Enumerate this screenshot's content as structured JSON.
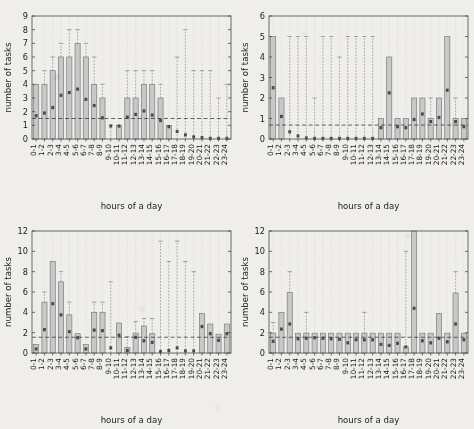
{
  "figure": {
    "background_color": "#efeeea",
    "panel_count": 4,
    "shared_xlabel": "hours of a day",
    "shared_ylabel": "number of tasks",
    "hour_categories": [
      "0-1",
      "1-2",
      "2-3",
      "3-4",
      "4-5",
      "5-6",
      "6-7",
      "7-8",
      "8-9",
      "9-10",
      "10-11",
      "11-12",
      "12-13",
      "13-14",
      "14-15",
      "15-16",
      "16-17",
      "17-18",
      "18-19",
      "19-20",
      "20-21",
      "21-22",
      "22-23",
      "23-24"
    ],
    "bar_fill_color": "#c8c8c8",
    "bar_edge_color": "#7d7d7d",
    "median_marker_color": "#4a4a4a",
    "whisker_color": "#8e8e8e",
    "mean_line_color": "#333333"
  },
  "chart_data": [
    {
      "id": "panel-top-left",
      "type": "bar",
      "title": "",
      "xlabel": "hours of a day",
      "ylabel": "number of tasks",
      "xlim": [
        0,
        24
      ],
      "ylim": [
        0,
        9
      ],
      "yticks": [
        0,
        1,
        2,
        3,
        4,
        5,
        6,
        7,
        8,
        9
      ],
      "ytick_labels": [
        "0",
        "1",
        "2",
        "3",
        "4",
        "5",
        "6",
        "7",
        "8",
        "9"
      ],
      "grid": "vertical-dashed",
      "mean_reference_line": 1.5,
      "categories": [
        "0-1",
        "1-2",
        "2-3",
        "3-4",
        "4-5",
        "5-6",
        "6-7",
        "7-8",
        "8-9",
        "9-10",
        "10-11",
        "11-12",
        "12-13",
        "13-14",
        "14-15",
        "15-16",
        "16-17",
        "17-18",
        "18-19",
        "19-20",
        "20-21",
        "21-22",
        "22-23",
        "23-24"
      ],
      "values": [
        4,
        4,
        5,
        6,
        6,
        7,
        6,
        4,
        3,
        0,
        1,
        3,
        3,
        4,
        4,
        3,
        1,
        0,
        0,
        0,
        0,
        0,
        0,
        0
      ],
      "medians": [
        1.7,
        1.9,
        2.3,
        3.2,
        3.4,
        3.65,
        2.9,
        2.45,
        1.55,
        0.95,
        0.95,
        1.6,
        1.8,
        2.05,
        1.75,
        1.35,
        0.9,
        0.55,
        0.3,
        0.15,
        0.1,
        0.05,
        0.05,
        0.05
      ],
      "whisker_tops": [
        4,
        5,
        6,
        7,
        8,
        8,
        7,
        6,
        4,
        1,
        1,
        5,
        5,
        5,
        5,
        4,
        1,
        6,
        8,
        5,
        5,
        5,
        3,
        4
      ]
    },
    {
      "id": "panel-top-right",
      "type": "bar",
      "title": "",
      "xlabel": "hours of a day",
      "ylabel": "number of tasks",
      "xlim": [
        0,
        24
      ],
      "ylim": [
        0,
        6
      ],
      "yticks": [
        0,
        1,
        2,
        3,
        4,
        5,
        6
      ],
      "ytick_labels": [
        "0",
        "1",
        "2",
        "3",
        "4",
        "5",
        "6"
      ],
      "grid": "vertical-dashed",
      "mean_reference_line": 0.68,
      "categories": [
        "0-1",
        "1-2",
        "2-3",
        "3-4",
        "4-5",
        "5-6",
        "6-7",
        "7-8",
        "8-9",
        "9-10",
        "10-11",
        "11-12",
        "12-13",
        "13-14",
        "14-15",
        "15-16",
        "16-17",
        "17-18",
        "18-19",
        "19-20",
        "20-21",
        "21-22",
        "22-23",
        "23-24"
      ],
      "values": [
        5,
        2,
        0,
        0,
        0,
        0,
        0,
        0,
        0,
        0,
        0,
        0,
        0,
        1,
        4,
        1,
        1,
        2,
        2,
        1,
        2,
        5,
        1,
        1
      ],
      "medians": [
        2.5,
        1.1,
        0.35,
        0.15,
        0.05,
        0.03,
        0.03,
        0.03,
        0.03,
        0.03,
        0.03,
        0.03,
        0.03,
        0.55,
        2.25,
        0.6,
        0.55,
        0.95,
        1.22,
        0.85,
        1.05,
        2.38,
        0.85,
        0.6
      ],
      "whisker_tops": [
        5,
        2,
        5,
        5,
        5,
        2,
        5,
        5,
        4,
        5,
        5,
        5,
        5,
        1,
        4,
        1,
        1,
        2,
        2,
        2,
        2,
        5,
        2,
        1
      ]
    },
    {
      "id": "panel-bottom-left",
      "type": "bar",
      "title": "",
      "xlabel": "hours of a day",
      "ylabel": "number of tasks",
      "xlim": [
        0,
        24
      ],
      "ylim": [
        0,
        12
      ],
      "yticks": [
        0,
        2,
        4,
        6,
        8,
        10,
        12
      ],
      "ytick_labels": [
        "0",
        "2",
        "4",
        "6",
        "8",
        "10",
        "12"
      ],
      "grid": "vertical-dashed",
      "mean_reference_line": 1.55,
      "categories": [
        "0-1",
        "1-2",
        "2-3",
        "3-4",
        "4-5",
        "5-6",
        "6-7",
        "7-8",
        "8-9",
        "9-10",
        "10-11",
        "11-12",
        "12-13",
        "13-14",
        "14-15",
        "15-16",
        "16-17",
        "17-18",
        "18-19",
        "19-20",
        "20-21",
        "21-22",
        "22-23",
        "23-24"
      ],
      "values": [
        0.85,
        5,
        9,
        7,
        3.75,
        1.9,
        0.85,
        4,
        4,
        0,
        2.95,
        0.55,
        1.95,
        2.65,
        1.9,
        0,
        0,
        0,
        0,
        0,
        3.9,
        2.85,
        1.85,
        2.85
      ],
      "medians": [
        0.4,
        2.3,
        4.85,
        3.75,
        2.1,
        1.5,
        0.4,
        2.25,
        2.2,
        0.5,
        1.75,
        0.25,
        1.55,
        1.2,
        1.05,
        0.15,
        0.25,
        0.5,
        0.2,
        0.2,
        2.6,
        1.9,
        1.25,
        1.9
      ],
      "whisker_tops": [
        0.85,
        6,
        9,
        8,
        5,
        1.9,
        0.85,
        5,
        5,
        7,
        2.95,
        1.6,
        3.1,
        3.4,
        3.4,
        11,
        9,
        11,
        9,
        8,
        3.9,
        2.85,
        1.85,
        2.85
      ]
    },
    {
      "id": "panel-bottom-right",
      "type": "bar",
      "title": "",
      "xlabel": "hours of a day",
      "ylabel": "number of tasks",
      "xlim": [
        0,
        24
      ],
      "ylim": [
        0,
        12
      ],
      "yticks": [
        0,
        2,
        4,
        6,
        8,
        10,
        12
      ],
      "ytick_labels": [
        "0",
        "2",
        "4",
        "6",
        "8",
        "10",
        "12"
      ],
      "grid": "vertical-dashed",
      "mean_reference_line": 1.55,
      "categories": [
        "0-1",
        "1-2",
        "2-3",
        "3-4",
        "4-5",
        "5-6",
        "6-7",
        "7-8",
        "8-9",
        "9-10",
        "10-11",
        "11-12",
        "12-13",
        "13-14",
        "14-15",
        "15-16",
        "16-17",
        "17-18",
        "18-19",
        "19-20",
        "20-21",
        "21-22",
        "22-23",
        "23-24"
      ],
      "values": [
        1.95,
        4,
        5.95,
        1.95,
        1.95,
        1.95,
        1.95,
        1.95,
        1.95,
        1.95,
        1.95,
        1.95,
        1.95,
        1.95,
        1.95,
        1.95,
        0.6,
        12,
        1.95,
        1.95,
        3.9,
        1.95,
        5.9,
        1.95
      ],
      "medians": [
        1.15,
        2.35,
        2.85,
        1.4,
        1.45,
        1.5,
        1.45,
        1.4,
        1.35,
        1.0,
        1.3,
        1.3,
        1.3,
        0.85,
        0.75,
        0.95,
        0.6,
        4.4,
        1.2,
        1.0,
        1.45,
        1.1,
        2.85,
        1.3
      ],
      "whisker_tops": [
        3,
        4,
        8,
        1.95,
        4,
        1.95,
        1.95,
        1.95,
        1.95,
        1.95,
        1.95,
        4,
        1.95,
        1.95,
        1.95,
        1.95,
        10,
        12,
        1.95,
        1.95,
        3.9,
        1.95,
        8,
        1.95
      ]
    }
  ]
}
